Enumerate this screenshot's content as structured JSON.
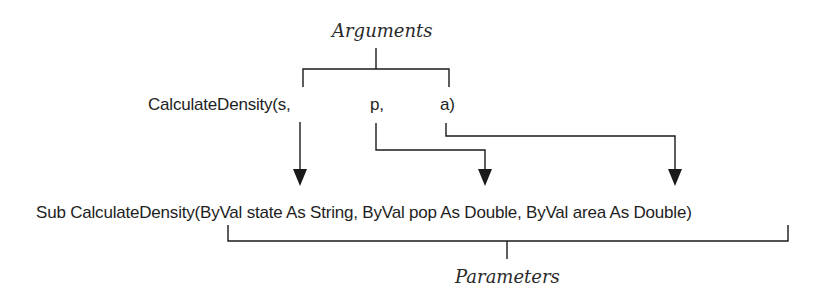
{
  "labels": {
    "arguments": "Arguments",
    "parameters": "Parameters"
  },
  "call": {
    "prefix": "CalculateDensity(s,",
    "arg_p": "p,",
    "arg_a": "a)"
  },
  "declaration": "Sub CalculateDensity(ByVal state As String, ByVal pop As Double, ByVal area As Double)",
  "colors": {
    "line": "#1a1a1a",
    "text": "#1e1e1e"
  }
}
